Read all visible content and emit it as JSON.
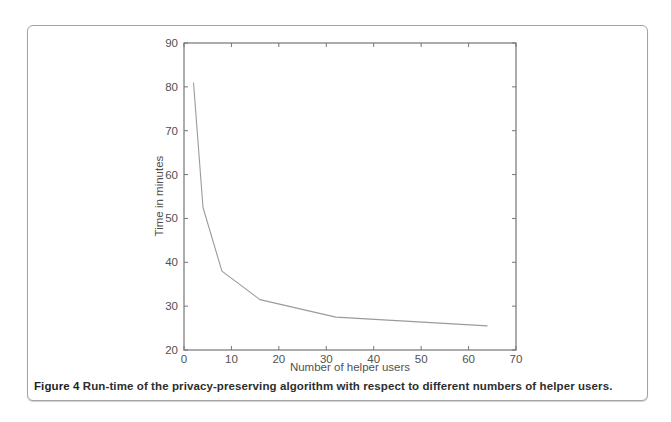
{
  "figure": {
    "caption_label": "Figure 4",
    "caption_text": "Run-time of the privacy-preserving algorithm with respect to different numbers of helper users."
  },
  "chart_data": {
    "type": "line",
    "title": "",
    "xlabel": "Number of helper users",
    "ylabel": "Time in minutes",
    "x": [
      2,
      4,
      8,
      16,
      32,
      64
    ],
    "y": [
      81,
      52.5,
      38,
      31.5,
      27.5,
      25.5
    ],
    "xlim": [
      0,
      70
    ],
    "ylim": [
      20,
      90
    ],
    "xticks": [
      0,
      10,
      20,
      30,
      40,
      50,
      60,
      70
    ],
    "yticks": [
      20,
      30,
      40,
      50,
      60,
      70,
      80,
      90
    ],
    "grid": false,
    "legend": false,
    "line_color": "#9b9b9b",
    "axis_color": "#767676",
    "text_color": "#515151"
  }
}
